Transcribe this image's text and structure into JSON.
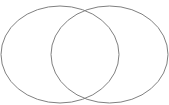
{
  "diagram": {
    "type": "venn",
    "stroke_color": "#808080",
    "background": "#ffffff",
    "sets": [
      {
        "name": "left-set",
        "cx": 60,
        "cy": 54.5,
        "rx": 59,
        "ry": 48.5
      },
      {
        "name": "right-set",
        "cx": 109.5,
        "cy": 54.5,
        "rx": 58.5,
        "ry": 48.5
      }
    ]
  }
}
